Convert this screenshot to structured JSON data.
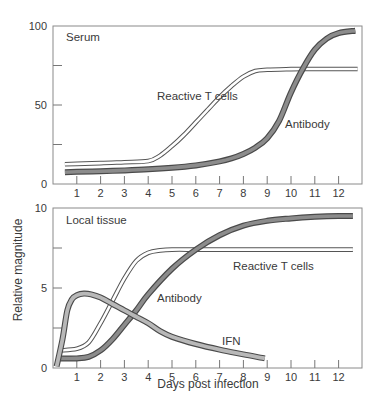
{
  "figure": {
    "shared_ylabel": "Relative magnitude",
    "shared_xlabel": "Days post infection"
  },
  "chart_data": [
    {
      "type": "line",
      "title": "Serum",
      "xlabel": "",
      "ylabel": "Relative magnitude",
      "xlim": [
        0,
        13
      ],
      "ylim": [
        0,
        100
      ],
      "xticks": [
        1,
        2,
        3,
        4,
        5,
        6,
        7,
        8,
        9,
        10,
        11,
        12
      ],
      "yticks": [
        0,
        25,
        50,
        75,
        100
      ],
      "ytick_labels": [
        "0",
        "",
        "50",
        "",
        "100"
      ],
      "grid": false,
      "series": [
        {
          "name": "Reactive T cells",
          "style": "double-line",
          "label_text": "Reactive T cells",
          "x": [
            0.5,
            1,
            2,
            3,
            4,
            4.5,
            5,
            5.5,
            6,
            6.5,
            7,
            7.5,
            8,
            8.5,
            9,
            10,
            11,
            12,
            12.8
          ],
          "y": [
            12.5,
            12.7,
            13.2,
            13.8,
            14.5,
            18,
            24,
            31,
            39,
            47,
            55,
            62,
            68,
            71.5,
            72.3,
            72.7,
            72.8,
            72.8,
            72.8
          ]
        },
        {
          "name": "Antibody",
          "style": "thick-gray",
          "label_text": "Antibody",
          "x": [
            0.5,
            1,
            2,
            3,
            4,
            5,
            6,
            7,
            7.5,
            8,
            8.5,
            9,
            9.5,
            10,
            10.5,
            11,
            11.5,
            12,
            12.7
          ],
          "y": [
            7.5,
            7.7,
            8.1,
            8.6,
            9.3,
            10.3,
            11.8,
            14.3,
            16.2,
            19,
            23,
            29,
            40,
            58,
            73,
            85,
            92,
            95.5,
            97
          ]
        }
      ]
    },
    {
      "type": "line",
      "title": "Local tissue",
      "xlabel": "Days post infection",
      "ylabel": "Relative magnitude",
      "xlim": [
        0,
        13
      ],
      "ylim": [
        0,
        10
      ],
      "xticks": [
        1,
        2,
        3,
        4,
        5,
        6,
        7,
        8,
        9,
        10,
        11,
        12
      ],
      "yticks": [
        0,
        2.5,
        5,
        7.5,
        10
      ],
      "ytick_labels": [
        "0",
        "",
        "5",
        "",
        "10"
      ],
      "grid": false,
      "series": [
        {
          "name": "Reactive T cells",
          "style": "double-line",
          "label_text": "Reactive T cells",
          "x": [
            0.3,
            1,
            1.5,
            2,
            2.5,
            3,
            3.5,
            4,
            4.5,
            5,
            6,
            7,
            8,
            9,
            10,
            11,
            12,
            12.6
          ],
          "y": [
            1.1,
            1.2,
            1.6,
            2.8,
            4.2,
            5.6,
            6.7,
            7.2,
            7.35,
            7.4,
            7.4,
            7.4,
            7.4,
            7.4,
            7.4,
            7.4,
            7.4,
            7.4
          ]
        },
        {
          "name": "Antibody",
          "style": "thick-gray",
          "label_text": "Antibody",
          "x": [
            0.3,
            1,
            1.5,
            2,
            2.5,
            3,
            3.5,
            4,
            5,
            6,
            7,
            8,
            9,
            10,
            11,
            12,
            12.6
          ],
          "y": [
            0.6,
            0.6,
            0.7,
            1.1,
            1.8,
            2.7,
            3.6,
            4.6,
            6.2,
            7.4,
            8.3,
            8.9,
            9.2,
            9.35,
            9.45,
            9.5,
            9.5
          ]
        },
        {
          "name": "IFN",
          "style": "light-gray",
          "label_text": "IFN",
          "x": [
            0.15,
            0.4,
            0.6,
            0.8,
            1,
            1.3,
            1.6,
            2,
            2.5,
            3,
            3.5,
            4,
            4.5,
            5,
            6,
            7,
            8,
            8.9
          ],
          "y": [
            0.1,
            1.8,
            3.6,
            4.3,
            4.55,
            4.65,
            4.6,
            4.4,
            4.0,
            3.6,
            3.2,
            2.8,
            2.3,
            1.95,
            1.5,
            1.15,
            0.85,
            0.6
          ]
        }
      ]
    }
  ]
}
